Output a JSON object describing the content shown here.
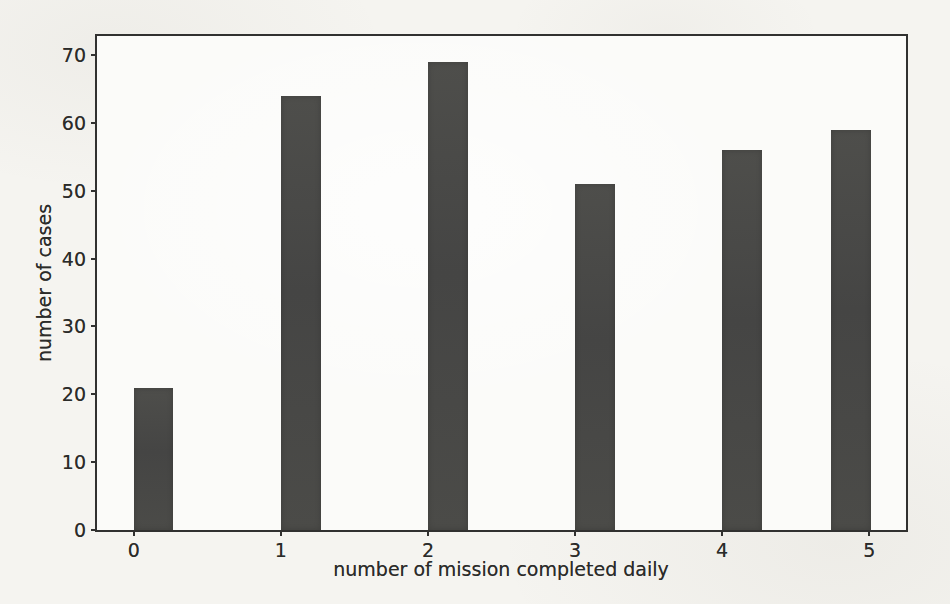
{
  "chart_data": {
    "type": "bar",
    "title": "",
    "xlabel": "number of mission completed daily",
    "ylabel": "number of cases",
    "categories": [
      "0",
      "1",
      "2",
      "3",
      "4",
      "5"
    ],
    "values": [
      21,
      64,
      69,
      51,
      56,
      59
    ],
    "xticks": [
      0,
      1,
      2,
      3,
      4,
      5
    ],
    "yticks": [
      0,
      10,
      20,
      30,
      40,
      50,
      60,
      70
    ],
    "xlim": [
      -0.25,
      5.25
    ],
    "ylim": [
      0,
      72.8
    ],
    "bar_left_edges": [
      0,
      1,
      2,
      3,
      4,
      4.74
    ],
    "bar_width_units": 0.27,
    "grid": false,
    "legend": null,
    "colors": {
      "bar": "#4a4a48",
      "spine": "#313130",
      "text": "#2b2b29",
      "plot_background": "#fbfbf9",
      "page_background": "#f5f4f0"
    }
  }
}
